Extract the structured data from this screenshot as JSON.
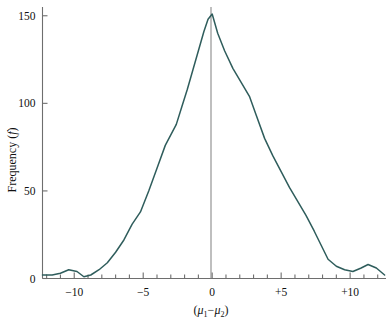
{
  "chart_data": {
    "type": "line",
    "title": "",
    "subtitle": "",
    "xlabel": "(μ₁ − μ₂)",
    "ylabel": "Frequency (f)",
    "xlim": [
      -12.3,
      12.6
    ],
    "ylim": [
      0,
      155
    ],
    "grid": false,
    "legend": null,
    "x_ticks_major": [
      -10,
      -5,
      0,
      5,
      10
    ],
    "x_tick_labels": [
      "−10",
      "−5",
      "0",
      "+5",
      "+10"
    ],
    "x_minor_tick_step": 1,
    "y_ticks": [
      0,
      50,
      100,
      150
    ],
    "y_tick_labels": [
      "0",
      "50",
      "100",
      "150"
    ],
    "reference_line_x": 0,
    "series": [
      {
        "name": "Frequency",
        "color": "#2f5d5c",
        "x": [
          -12.3,
          -11.6,
          -11.0,
          -10.4,
          -9.8,
          -9.3,
          -8.8,
          -8.2,
          -7.6,
          -7.0,
          -6.4,
          -5.8,
          -5.2,
          -4.6,
          -4.0,
          -3.4,
          -3.0,
          -2.6,
          -2.2,
          -1.8,
          -1.4,
          -1.0,
          -0.6,
          -0.3,
          0.0,
          0.4,
          0.9,
          1.5,
          2.1,
          2.7,
          3.2,
          3.8,
          4.4,
          5.0,
          5.6,
          6.2,
          6.8,
          7.4,
          7.9,
          8.4,
          9.0,
          9.6,
          10.2,
          10.8,
          11.3,
          11.9,
          12.5
        ],
        "y": [
          2,
          2,
          3,
          5,
          4,
          1,
          2,
          5,
          9,
          15,
          22,
          31,
          38,
          50,
          63,
          76,
          82,
          88,
          98,
          108,
          119,
          130,
          141,
          148,
          151,
          140,
          130,
          120,
          112,
          104,
          93,
          80,
          70,
          61,
          52,
          44,
          36,
          27,
          19,
          11,
          7,
          5,
          4,
          6,
          8,
          6,
          2
        ]
      }
    ]
  },
  "axes": {
    "y_axis_label": "Frequency (f)",
    "y_axis_label_variable": "f",
    "x_axis_label_prefix": "(",
    "x_axis_label_mu1": "μ",
    "x_axis_label_sub1": "1",
    "x_axis_label_minus": "−",
    "x_axis_label_mu2": "μ",
    "x_axis_label_sub2": "2",
    "x_axis_label_suffix": ")"
  },
  "colors": {
    "curve": "#2f5d5c",
    "axis": "#6e6e6e",
    "reference_line": "#8a8a8a",
    "text": "#111111",
    "background": "#ffffff"
  }
}
